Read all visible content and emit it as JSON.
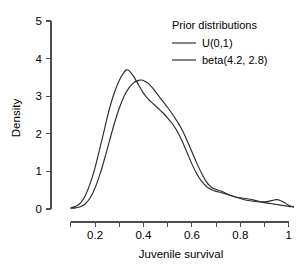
{
  "chart_data": {
    "type": "line",
    "title": "",
    "xlabel": "Juvenile survival",
    "ylabel": "Density",
    "xlim": [
      0.08,
      1.03
    ],
    "ylim": [
      0,
      5
    ],
    "grid": false,
    "legend_position": "top-right",
    "legend_title": "Prior distributions",
    "x_ticks_major": [
      0.2,
      0.4,
      0.6,
      0.8,
      1
    ],
    "x_tick_labels": [
      "0.2",
      "0.4",
      "0.6",
      "0.8",
      "1"
    ],
    "x_ticks_minor": [
      0.1,
      0.3,
      0.5,
      0.7,
      0.9
    ],
    "y_ticks": [
      0,
      1,
      2,
      3,
      4,
      5
    ],
    "y_tick_labels": [
      "0",
      "1",
      "2",
      "3",
      "4",
      "5"
    ],
    "series": [
      {
        "name": "U(0,1)",
        "x": [
          0.1,
          0.12,
          0.14,
          0.16,
          0.18,
          0.2,
          0.22,
          0.24,
          0.26,
          0.28,
          0.3,
          0.32,
          0.34,
          0.36,
          0.38,
          0.39,
          0.4,
          0.42,
          0.44,
          0.46,
          0.48,
          0.5,
          0.52,
          0.54,
          0.56,
          0.58,
          0.6,
          0.62,
          0.64,
          0.66,
          0.68,
          0.7,
          0.72,
          0.74,
          0.76,
          0.78,
          0.8,
          0.82,
          0.84,
          0.86,
          0.88,
          0.9,
          0.92,
          0.94,
          0.96,
          0.98,
          1.0,
          1.02
        ],
        "values": [
          0.02,
          0.03,
          0.06,
          0.14,
          0.3,
          0.56,
          0.92,
          1.35,
          1.82,
          2.28,
          2.68,
          3.0,
          3.22,
          3.36,
          3.42,
          3.43,
          3.42,
          3.34,
          3.2,
          3.03,
          2.86,
          2.7,
          2.52,
          2.32,
          2.1,
          1.82,
          1.52,
          1.22,
          0.95,
          0.72,
          0.58,
          0.52,
          0.48,
          0.42,
          0.36,
          0.32,
          0.3,
          0.28,
          0.26,
          0.23,
          0.2,
          0.17,
          0.15,
          0.13,
          0.11,
          0.09,
          0.07,
          0.06
        ]
      },
      {
        "name": "beta(4.2, 2.8)",
        "x": [
          0.1,
          0.12,
          0.14,
          0.16,
          0.18,
          0.2,
          0.22,
          0.24,
          0.26,
          0.28,
          0.3,
          0.32,
          0.33,
          0.34,
          0.36,
          0.38,
          0.4,
          0.42,
          0.44,
          0.46,
          0.48,
          0.5,
          0.52,
          0.54,
          0.56,
          0.58,
          0.6,
          0.62,
          0.64,
          0.66,
          0.68,
          0.7,
          0.72,
          0.74,
          0.76,
          0.78,
          0.8,
          0.82,
          0.84,
          0.86,
          0.88,
          0.9,
          0.92,
          0.94,
          0.95,
          0.96,
          0.98,
          1.0,
          1.02
        ],
        "values": [
          0.03,
          0.07,
          0.16,
          0.36,
          0.68,
          1.1,
          1.62,
          2.15,
          2.68,
          3.1,
          3.42,
          3.64,
          3.7,
          3.68,
          3.52,
          3.3,
          3.08,
          2.92,
          2.8,
          2.68,
          2.56,
          2.42,
          2.26,
          2.06,
          1.8,
          1.5,
          1.2,
          0.94,
          0.74,
          0.6,
          0.52,
          0.47,
          0.44,
          0.4,
          0.36,
          0.32,
          0.28,
          0.24,
          0.22,
          0.2,
          0.19,
          0.19,
          0.21,
          0.24,
          0.25,
          0.24,
          0.18,
          0.1,
          0.05
        ]
      }
    ]
  },
  "legend": {
    "title": "Prior distributions",
    "items": [
      {
        "label": "U(0,1)"
      },
      {
        "label": "beta(4.2, 2.8)"
      }
    ]
  },
  "axes": {
    "x_title": "Juvenile survival",
    "y_title": "Density"
  }
}
